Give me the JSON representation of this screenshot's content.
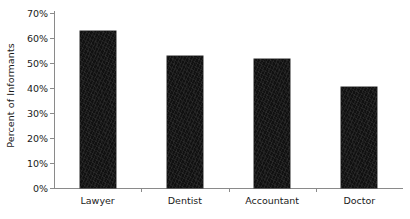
{
  "chart_data": {
    "type": "bar",
    "title": "",
    "xlabel": "",
    "ylabel": "Percent of Informants",
    "categories": [
      "Lawyer",
      "Dentist",
      "Accountant",
      "Doctor"
    ],
    "values": [
      63,
      53,
      51.5,
      40.5
    ],
    "ylim": [
      0,
      70
    ],
    "ytick_step": 10,
    "ytick_labels": [
      "0%",
      "10%",
      "20%",
      "30%",
      "40%",
      "50%",
      "60%",
      "70%"
    ],
    "ytick_values": [
      0,
      10,
      20,
      30,
      40,
      50,
      60,
      70
    ],
    "grid": false,
    "legend": null,
    "bar_color": "#111111",
    "axis_color": "#8a8a8a",
    "text_color": "#1a1a1a",
    "background_color": "#ffffff"
  }
}
